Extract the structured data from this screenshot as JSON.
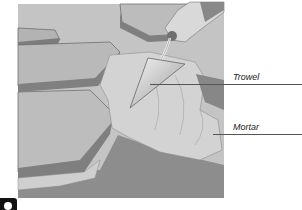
{
  "diagram": {
    "labels": [
      {
        "id": "trowel",
        "text": "Trowel"
      },
      {
        "id": "mortar",
        "text": "Mortar"
      }
    ],
    "colors": {
      "background": "#c9c9c9",
      "stone_top": "#b8b8b8",
      "stone_edge": "#7e7e7e",
      "mortar": "#d6d6d6",
      "ground": "#8f8f8f"
    }
  }
}
